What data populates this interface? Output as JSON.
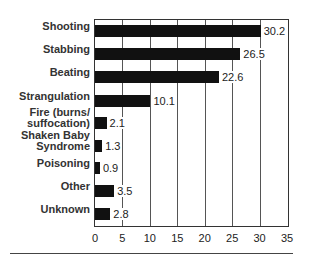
{
  "chart_data": {
    "type": "bar",
    "orientation": "horizontal",
    "title": "",
    "xlabel": "",
    "ylabel": "",
    "categories": [
      "Shooting",
      "Stabbing",
      "Beating",
      "Strangulation",
      "Fire (burns/ suffocation)",
      "Shaken Baby Syndrome",
      "Poisoning",
      "Other",
      "Unknown"
    ],
    "category_lines": [
      [
        "Shooting"
      ],
      [
        "Stabbing"
      ],
      [
        "Beating"
      ],
      [
        "Strangulation"
      ],
      [
        "Fire (burns/",
        "suffocation)"
      ],
      [
        "Shaken Baby",
        "Syndrome"
      ],
      [
        "Poisoning"
      ],
      [
        "Other"
      ],
      [
        "Unknown"
      ]
    ],
    "values": [
      30.2,
      26.5,
      22.6,
      10.1,
      2.1,
      1.3,
      0.9,
      3.5,
      2.8
    ],
    "value_labels": [
      "30.2",
      "26.5",
      "22.6",
      "10.1",
      "2.1",
      "1.3",
      "0.9",
      "3.5",
      "2.8"
    ],
    "xlim": [
      0,
      35
    ],
    "xticks": [
      "0",
      "5",
      "10",
      "15",
      "20",
      "25",
      "30",
      "35"
    ],
    "grid": true,
    "legend": null,
    "bar_color": "#111111"
  }
}
